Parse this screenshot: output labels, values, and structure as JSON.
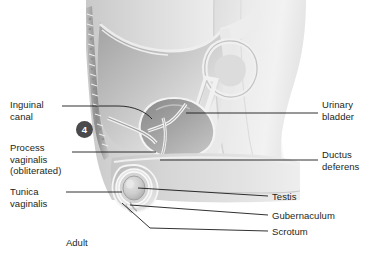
{
  "figure": {
    "caption": "Adult",
    "stage_badge": "4",
    "background_color": "#ffffff",
    "text_color": "#231f20",
    "badge_color": "#4a4a4c",
    "leader_color": "#1a1a1a"
  },
  "labels_left": [
    {
      "name": "inguinal-canal",
      "lines": [
        "Inguinal",
        "canal"
      ],
      "x": 10,
      "y": 99
    },
    {
      "name": "process-vaginalis",
      "lines": [
        "Process",
        "vaginalis",
        "(obliterated)"
      ],
      "x": 10,
      "y": 142
    },
    {
      "name": "tunica-vaginalis",
      "lines": [
        "Tunica",
        "vaginalis"
      ],
      "x": 10,
      "y": 186
    }
  ],
  "labels_right": [
    {
      "name": "urinary-bladder",
      "lines": [
        "Urinary",
        "bladder"
      ],
      "x": 322,
      "y": 99
    },
    {
      "name": "ductus-deferens",
      "lines": [
        "Ductus",
        "deferens"
      ],
      "x": 322,
      "y": 149
    },
    {
      "name": "testis",
      "lines": [
        "Testis"
      ],
      "x": 272,
      "y": 191
    },
    {
      "name": "gubernaculum",
      "lines": [
        "Gubernaculum"
      ],
      "x": 272,
      "y": 210
    },
    {
      "name": "scrotum",
      "lines": [
        "Scrotum"
      ],
      "x": 272,
      "y": 226
    }
  ],
  "illustration": {
    "type": "grayscale-sagittal-anatomical-drawing",
    "description": "Median sagittal section of adult male pelvis showing abdominal wall, vertebral column, urinary bladder, ductus deferens, inguinal canal and scrotum with testis",
    "structures": [
      "abdominal-wall",
      "vertebral-column",
      "peritoneal-cavity",
      "urinary-bladder",
      "bowel-loop",
      "ductus-deferens",
      "inguinal-canal",
      "scrotum",
      "testis",
      "tunica-vaginalis",
      "gubernaculum"
    ]
  }
}
